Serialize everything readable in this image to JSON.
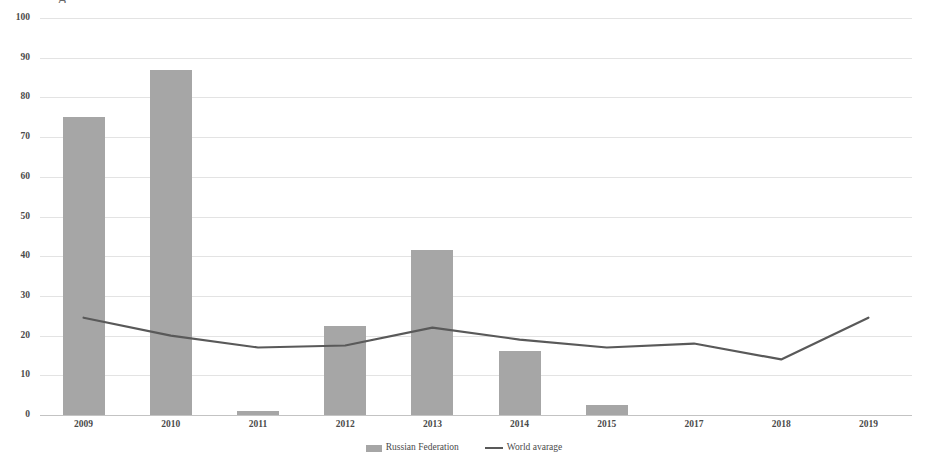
{
  "title_remnant": "g",
  "chart_data": {
    "type": "bar",
    "title": "",
    "subtitle": "",
    "xlabel": "",
    "ylabel": "",
    "ylim": [
      0,
      100
    ],
    "ytick_step": 10,
    "yticks": [
      "100",
      "90",
      "80",
      "70",
      "60",
      "50",
      "40",
      "30",
      "20",
      "10",
      "0"
    ],
    "grid": true,
    "legend_position": "bottom",
    "categories": [
      "2009",
      "2010",
      "2011",
      "2012",
      "2013",
      "2014",
      "2015",
      "2017",
      "2018",
      "2019"
    ],
    "series": [
      {
        "name": "Russian Federation",
        "type": "bar",
        "color": "#a6a6a6",
        "values": [
          75,
          87,
          1,
          22.5,
          41.5,
          16,
          2.5,
          0,
          0,
          0
        ]
      },
      {
        "name": "World avarage",
        "type": "line",
        "color": "#595959",
        "values": [
          24.5,
          20,
          17,
          17.5,
          22,
          19,
          17,
          18,
          14,
          24.5
        ]
      }
    ]
  },
  "legend": {
    "items": [
      {
        "label": "Russian Federation",
        "marker": "bar-swatch",
        "color": "#a6a6a6"
      },
      {
        "label": "World avarage",
        "marker": "line-swatch",
        "color": "#595959"
      }
    ]
  },
  "colors": {
    "bar": "#a6a6a6",
    "line": "#595959",
    "grid": "#d9d9d9",
    "text": "#4a4a4a",
    "background": "#ffffff"
  }
}
